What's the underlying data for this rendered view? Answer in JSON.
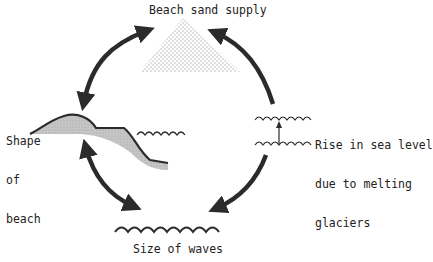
{
  "diagram": {
    "title": "Beach sand supply",
    "nodes": {
      "sand_supply": {
        "label": "Beach sand supply"
      },
      "shape_of_beach": {
        "lines": [
          "Shape",
          "of",
          "beach"
        ]
      },
      "sea_level": {
        "lines": [
          "Rise in sea level",
          "due to melting",
          "glaciers"
        ]
      },
      "wave_size": {
        "label": "Size of waves"
      }
    },
    "arrows": [
      {
        "from": "sand_supply",
        "to": "shape_of_beach",
        "type": "double-headed"
      },
      {
        "from": "sea_level",
        "to": "sand_supply",
        "type": "single-headed"
      },
      {
        "from": "shape_of_beach",
        "to": "wave_size",
        "type": "double-headed"
      },
      {
        "from": "sea_level",
        "to": "wave_size",
        "type": "single-headed"
      }
    ],
    "colors": {
      "line": "#2b2b2b",
      "sand_fill": "#bdbdbd",
      "stipple": "#555555",
      "background": "#ffffff"
    }
  }
}
